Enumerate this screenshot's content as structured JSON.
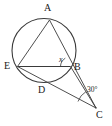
{
  "figure": {
    "background_color": "#ffffff",
    "stroke_color": "#3a3a3a",
    "label_color": "#1a1a1a",
    "width": 112,
    "height": 126
  },
  "labels": {
    "point_a": "A",
    "point_b": "B",
    "point_c": "C",
    "point_d": "D",
    "point_e": "E",
    "angle_x": "x",
    "angle_c": "30°"
  },
  "geometry": {
    "circle": {
      "cx": 44,
      "cy": 50.5,
      "r": 32
    },
    "points": {
      "A": {
        "x": 49.5,
        "y": 20.0
      },
      "B": {
        "x": 70.5,
        "y": 66.5
      },
      "C": {
        "x": 96.0,
        "y": 108.0
      },
      "D": {
        "x": 45.0,
        "y": 82.0
      },
      "E": {
        "x": 17.5,
        "y": 66.5
      }
    },
    "segments": [
      {
        "name": "chord-EB",
        "from": "E",
        "to": "B"
      },
      {
        "name": "line-A-to-C",
        "from": "A",
        "to": "C"
      },
      {
        "name": "line-E-to-C",
        "from": "E",
        "to": "C"
      },
      {
        "name": "segment-B-to-C",
        "from": "B",
        "to": "C"
      },
      {
        "name": "chord-A-to-E",
        "from": "A",
        "to": "E"
      }
    ],
    "angles": [
      {
        "name": "angle-x-at-B",
        "vertex": "B",
        "value_label": "x"
      },
      {
        "name": "angle-30-at-C",
        "vertex": "C",
        "value_label": "30°"
      }
    ]
  },
  "label_positions": {
    "point_a": {
      "left": 44,
      "top": 3
    },
    "point_b": {
      "left": 74,
      "top": 62
    },
    "point_c": {
      "left": 96,
      "top": 110
    },
    "point_d": {
      "left": 38,
      "top": 85
    },
    "point_e": {
      "left": 4,
      "top": 61
    },
    "angle_x": {
      "left": 59,
      "top": 56
    },
    "angle_c": {
      "left": 87,
      "top": 86
    }
  }
}
